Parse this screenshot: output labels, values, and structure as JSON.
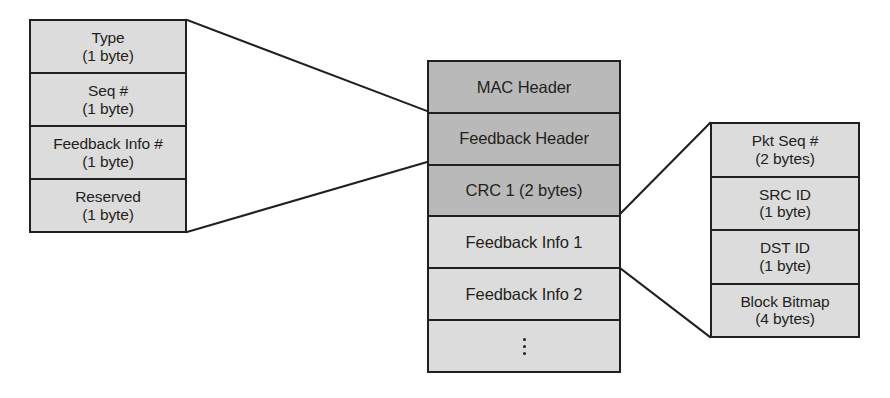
{
  "diagram": {
    "colors": {
      "shade_dark": "#b9b9b9",
      "shade_light": "#dcdcdc",
      "outline": "#231f20",
      "background": "#ffffff"
    }
  },
  "left_table": {
    "name": "Feedback Header fields",
    "rows": [
      {
        "label": "Type",
        "size": "(1 byte)"
      },
      {
        "label": "Seq #",
        "size": "(1 byte)"
      },
      {
        "label": "Feedback Info #",
        "size": "(1 byte)"
      },
      {
        "label": "Reserved",
        "size": "(1 byte)"
      }
    ]
  },
  "middle_stack": {
    "name": "Feedback packet layout",
    "rows": [
      {
        "label": "MAC Header",
        "shade": "dark"
      },
      {
        "label": "Feedback Header",
        "shade": "dark"
      },
      {
        "label": "CRC 1 (2 bytes)",
        "shade": "dark"
      },
      {
        "label": "Feedback Info 1",
        "shade": "light"
      },
      {
        "label": "Feedback Info 2",
        "shade": "light"
      },
      {
        "label": "⋮",
        "shade": "light",
        "is_ellipsis": true
      }
    ]
  },
  "right_table": {
    "name": "Feedback Info fields",
    "rows": [
      {
        "label": "Pkt Seq #",
        "size": "(2 bytes)"
      },
      {
        "label": "SRC ID",
        "size": "(1 byte)"
      },
      {
        "label": "DST ID",
        "size": "(1 byte)"
      },
      {
        "label": "Block Bitmap",
        "size": "(4 bytes)"
      }
    ]
  },
  "connectors": [
    {
      "name": "feedback-header-expansion-top",
      "from": {
        "x": 187,
        "y": 20
      },
      "to": {
        "x": 427,
        "y": 111
      }
    },
    {
      "name": "feedback-header-expansion-bottom",
      "from": {
        "x": 187,
        "y": 232
      },
      "to": {
        "x": 427,
        "y": 162
      }
    },
    {
      "name": "feedback-info-expansion-top",
      "from": {
        "x": 620,
        "y": 214
      },
      "to": {
        "x": 710,
        "y": 123
      }
    },
    {
      "name": "feedback-info-expansion-bottom",
      "from": {
        "x": 620,
        "y": 268
      },
      "to": {
        "x": 710,
        "y": 337
      }
    }
  ]
}
